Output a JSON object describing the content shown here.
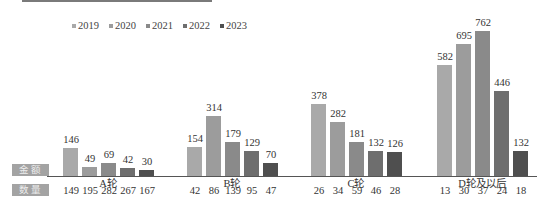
{
  "chart_data": {
    "type": "bar",
    "title": "",
    "xlabel": "",
    "ylabel": "",
    "legend_position": "top",
    "grid": false,
    "categories": [
      "A轮",
      "B轮",
      "C轮",
      "D轮及以后"
    ],
    "row_labels": {
      "amount": "金额",
      "count": "数量"
    },
    "series": [
      {
        "name": "2019",
        "color": "#a9a9a9",
        "values": [
          146,
          154,
          378,
          582
        ],
        "counts": [
          149,
          42,
          26,
          13
        ]
      },
      {
        "name": "2020",
        "color": "#9c9c9c",
        "values": [
          49,
          314,
          282,
          695
        ],
        "counts": [
          195,
          86,
          34,
          30
        ]
      },
      {
        "name": "2021",
        "color": "#8a8a8a",
        "values": [
          69,
          179,
          181,
          762
        ],
        "counts": [
          282,
          139,
          59,
          37
        ]
      },
      {
        "name": "2022",
        "color": "#6e6e6e",
        "values": [
          42,
          129,
          132,
          446
        ],
        "counts": [
          267,
          95,
          46,
          24
        ]
      },
      {
        "name": "2023",
        "color": "#4f4f4f",
        "values": [
          30,
          70,
          126,
          132
        ],
        "counts": [
          167,
          47,
          28,
          18
        ]
      }
    ],
    "ylim": [
      0,
      800
    ]
  }
}
